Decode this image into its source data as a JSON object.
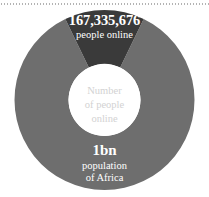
{
  "chart_data": {
    "type": "pie",
    "title": "",
    "subtitle": "",
    "xlabel": "",
    "ylabel": "",
    "center_label_lines": [
      "Number",
      "of people",
      "online"
    ],
    "legend_position": "none",
    "grid": false,
    "donut": true,
    "slices": [
      {
        "name": "people online",
        "value": 167335676,
        "value_label": "167,335,676",
        "label": "people online",
        "share_percent": 16.7,
        "color": "#3a3a3a",
        "text_color": "#ffffff"
      },
      {
        "name": "population of Africa",
        "value": 1000000000,
        "value_label": "1bn",
        "label_lines": [
          "population",
          "of Africa"
        ],
        "share_percent": 83.3,
        "color": "#6e6e6e",
        "text_color": "#ffffff"
      }
    ]
  },
  "figure": {
    "background": "#ffffff",
    "hole_color": "#ffffff",
    "center_text_color": "#d2d2d2",
    "rule_color": "#b3b3b3"
  },
  "online": {
    "value": "167,335,676",
    "label": "people online"
  },
  "center": {
    "line1": "Number",
    "line2": "of people",
    "line3": "online"
  },
  "population": {
    "value": "1bn",
    "line1": "population",
    "line2": "of Africa"
  }
}
